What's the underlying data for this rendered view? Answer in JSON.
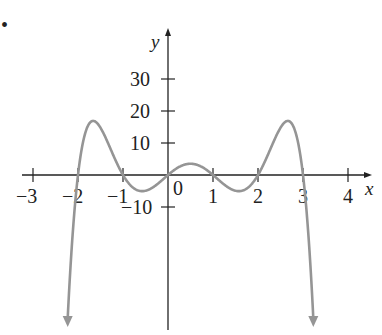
{
  "chart_data": {
    "type": "line",
    "title": "",
    "xlabel": "x",
    "ylabel": "y",
    "xlim": [
      -3.3,
      4.6
    ],
    "ylim": [
      -48,
      45
    ],
    "grid": false,
    "legend": null,
    "x_ticks": [
      -3,
      -2,
      -1,
      0,
      1,
      2,
      3,
      4
    ],
    "x_tick_labels": [
      "−3",
      "−2",
      "−1",
      "0",
      "1",
      "2",
      "3",
      "4"
    ],
    "y_ticks": [
      -10,
      10,
      20,
      30
    ],
    "y_tick_labels": [
      "−10",
      "10",
      "20",
      "30"
    ],
    "series": [
      {
        "name": "p(x) = -x(x+2)(x+1)(x-1)(x-2)(x-3)",
        "color": "#959595",
        "roots": [
          -2,
          -1,
          0,
          1,
          2,
          3
        ],
        "local_max": [
          {
            "x": -1.65,
            "y": 17
          },
          {
            "x": 0.5,
            "y": 2
          },
          {
            "x": 2.65,
            "y": 17
          }
        ],
        "local_min": [
          {
            "x": -0.6,
            "y": -6
          },
          {
            "x": 1.4,
            "y": -6
          }
        ],
        "end_behavior": "both ends go to -infinity (arrows pointing down)"
      }
    ],
    "annotations": [
      "bullet marker at top-left"
    ]
  },
  "labels": {
    "x_axis": "x",
    "y_axis": "y",
    "ticks_x": [
      "−3",
      "−2",
      "−1",
      "0",
      "1",
      "2",
      "3",
      "4"
    ],
    "ticks_y": [
      "30",
      "20",
      "10",
      "−10"
    ],
    "bullet": "•"
  },
  "colors": {
    "axis": "#222222",
    "curve": "#959595"
  }
}
